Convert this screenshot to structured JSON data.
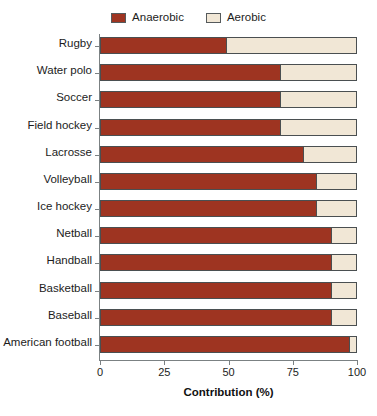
{
  "chart_data": {
    "type": "bar",
    "orientation": "horizontal",
    "stacked": true,
    "title": "",
    "xlabel": "Contribution (%)",
    "ylabel": "",
    "xlim": [
      0,
      100
    ],
    "xticks": [
      0,
      25,
      50,
      75,
      100
    ],
    "xtick_labels": [
      "0",
      "25",
      "50",
      "75",
      "100"
    ],
    "grid": false,
    "legend_position": "top-center",
    "categories": [
      "Rugby",
      "Water polo",
      "Soccer",
      "Field hockey",
      "Lacrosse",
      "Volleyball",
      "Ice hockey",
      "Netball",
      "Handball",
      "Basketball",
      "Baseball",
      "American football"
    ],
    "series": [
      {
        "name": "Anaerobic",
        "color": "#9E3421",
        "values": [
          49,
          70,
          70,
          70,
          79,
          84,
          84,
          90,
          90,
          90,
          90,
          97
        ]
      },
      {
        "name": "Aerobic",
        "color": "#F1E7D6",
        "values": [
          51,
          30,
          30,
          30,
          21,
          16,
          16,
          10,
          10,
          10,
          10,
          3
        ]
      }
    ]
  },
  "legend": {
    "entries": [
      {
        "label": "Anaerobic",
        "color": "#9E3421"
      },
      {
        "label": "Aerobic",
        "color": "#F1E7D6"
      }
    ]
  },
  "axis": {
    "x_title": "Contribution (%)"
  }
}
